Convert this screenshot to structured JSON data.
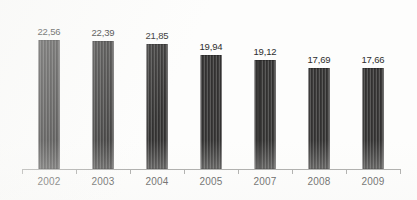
{
  "chart_data": {
    "type": "bar",
    "title": "",
    "subtitle": "",
    "xlabel": "",
    "ylabel": "",
    "categories": [
      "2002",
      "2003",
      "2004",
      "2005",
      "2007",
      "2008",
      "2009"
    ],
    "values": [
      22.56,
      22.39,
      21.85,
      19.94,
      19.12,
      17.69,
      17.66
    ],
    "value_labels": [
      "22,56",
      "22,39",
      "21,85",
      "19,94",
      "19,12",
      "17,69",
      "17,66"
    ],
    "decimal_separator": ",",
    "ylim": [
      0,
      24.5
    ],
    "grid": false,
    "legend": null,
    "legend_position": "none",
    "bar_color": "#3c3b3a",
    "bar_texture": "vertical-stripes",
    "axis_color": "#9a9a98",
    "text_color": "#2d2d2d",
    "background_color": "#fdfdfc"
  }
}
